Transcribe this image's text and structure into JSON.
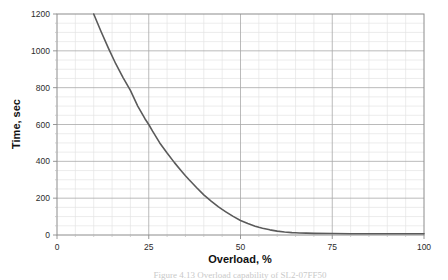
{
  "figure": {
    "background": "#ffffff",
    "plot_background": "#ffffff",
    "border_color": "#8c8c8c",
    "curve_color": "#5a5a5a",
    "grid_major_color": "#a8a8a8",
    "grid_minor_color": "#e4e4e4",
    "caption": "Figure 4.13   Overload capability of SL2-07FF50"
  },
  "chart_data": {
    "type": "line",
    "title": "",
    "xlabel": "Overload, %",
    "ylabel": "Time, sec",
    "xlim": [
      0,
      100
    ],
    "ylim": [
      0,
      1200
    ],
    "xticks": [
      0,
      25,
      50,
      75,
      100
    ],
    "yticks": [
      0,
      200,
      400,
      600,
      800,
      1000,
      1200
    ],
    "xtick_labels": [
      "0",
      "25",
      "50",
      "75",
      "100"
    ],
    "ytick_labels": [
      "0",
      "200",
      "400",
      "600",
      "800",
      "1000",
      "1200"
    ],
    "x_minor_step": 5,
    "y_minor_step": 50,
    "grid": true,
    "legend": null,
    "series": [
      {
        "name": "Overload capability",
        "color": "#5a5a5a",
        "x": [
          10,
          12,
          14,
          16,
          18,
          20,
          22,
          24,
          25,
          26,
          28,
          30,
          32,
          34,
          35,
          36,
          38,
          40,
          42,
          44,
          45,
          46,
          48,
          50,
          52,
          54,
          55,
          56,
          58,
          60,
          62,
          64,
          65,
          66,
          68,
          70,
          75,
          80,
          85,
          90,
          95,
          100
        ],
        "y": [
          1200,
          1105,
          1015,
          930,
          855,
          785,
          700,
          630,
          600,
          565,
          500,
          445,
          393,
          345,
          322,
          300,
          258,
          218,
          184,
          153,
          139,
          126,
          101,
          79,
          62,
          48,
          42,
          37,
          28,
          21,
          16,
          13,
          12,
          11,
          10,
          9,
          8,
          7,
          7,
          7,
          7,
          7
        ]
      }
    ]
  },
  "axes": {
    "x_axis_name": "Overload, %",
    "y_axis_name": "Time, sec"
  }
}
